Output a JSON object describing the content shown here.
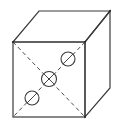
{
  "figure": {
    "colors": {
      "background": "#ffffff",
      "line": "#3a3a3a",
      "dashed": "#4a4a4a"
    },
    "faces": [
      "front",
      "top",
      "right"
    ],
    "front_face": {
      "diagonals": [
        "top-left to bottom-right",
        "top-right to bottom-left"
      ],
      "diagonal_style": "dashed",
      "holes": [
        {
          "name": "upper-right-hole",
          "marking": "slash"
        },
        {
          "name": "center-hole",
          "marking": "cross"
        },
        {
          "name": "lower-left-hole",
          "marking": "slash"
        }
      ]
    }
  }
}
